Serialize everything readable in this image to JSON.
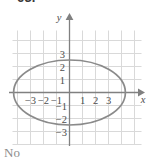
{
  "figure": {
    "problem_number": "63.",
    "answer": "No",
    "colors": {
      "grid": "#d9d9d9",
      "axis": "#808080",
      "curve": "#8a8a8a",
      "label": "#4d4d4d",
      "answer_text": "#8d8d8d",
      "background": "#ffffff"
    }
  },
  "chart_data": {
    "type": "line",
    "title": "",
    "subtitle": "",
    "xlabel": "x",
    "ylabel": "y",
    "curve_kind": "ellipse",
    "ellipse": {
      "center_x": 0,
      "center_y": 0,
      "semi_axis_x": 4.3,
      "semi_axis_y": 2.5,
      "equation": "x^2/18.5 + y^2/6.25 = 1"
    },
    "x_ticks": [
      -3,
      -2,
      -1,
      1,
      2,
      3
    ],
    "x_tick_labels": [
      "-3",
      "-2",
      "-1",
      "1",
      "2",
      "3"
    ],
    "y_ticks": [
      3,
      2,
      1,
      -1,
      -2,
      -3
    ],
    "y_tick_labels": [
      "3",
      "2",
      "1",
      "-1",
      "-2",
      "-3"
    ],
    "xlim": [
      -5.3,
      6.0
    ],
    "ylim": [
      -4.0,
      4.2
    ],
    "grid": true,
    "grid_step": 1,
    "legend": null,
    "legend_position": "none",
    "axis_arrows": [
      "x-positive",
      "y-positive"
    ],
    "annotations": []
  }
}
